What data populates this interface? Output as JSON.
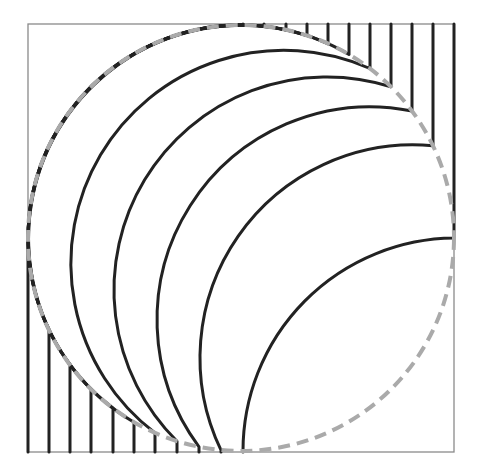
{
  "diagram": {
    "type": "field-lines-through-circle",
    "canvas": {
      "width": 480,
      "height": 474
    },
    "frame": {
      "x1": 28,
      "y1": 24,
      "x2": 454,
      "y2": 452,
      "stroke": "#8a8a8a",
      "width": 1.3
    },
    "circle": {
      "cx": 241,
      "cy": 238,
      "r": 213,
      "stroke": "#aaaaaa",
      "width": 4,
      "dash": "12 7"
    },
    "lines": {
      "stroke": "#222222",
      "width": 3,
      "bottom_x": [
        28,
        49,
        70,
        91,
        113,
        134,
        155,
        177,
        199,
        221,
        243
      ],
      "top_x": [
        243,
        264,
        286,
        307,
        328,
        349,
        370,
        391,
        412,
        433,
        454
      ]
    }
  }
}
